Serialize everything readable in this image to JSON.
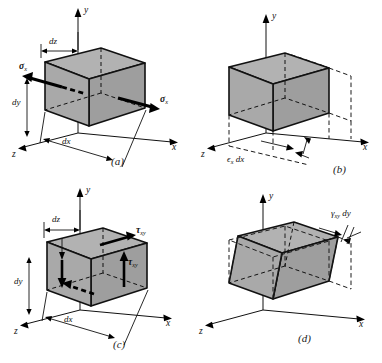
{
  "figure": {
    "background_color": "#ffffff",
    "face_color": "#a9a9a9",
    "line_color": "#111111"
  },
  "panels": [
    {
      "id": "a",
      "caption": "(a)",
      "description": "Cube element with normal stress sigma-x applied on both x-faces",
      "axes": {
        "x": "x",
        "y": "y",
        "z": "z"
      },
      "dimensions": [
        {
          "name": "dz",
          "label": "dz"
        },
        {
          "name": "dy",
          "label": "dy"
        },
        {
          "name": "dx",
          "label": "dx"
        }
      ],
      "stress_labels": [
        {
          "name": "sigma-x-left",
          "symbol": "σ",
          "subscript": "x"
        },
        {
          "name": "sigma-x-right",
          "symbol": "σ",
          "subscript": "x"
        }
      ]
    },
    {
      "id": "b",
      "caption": "(b)",
      "description": "Deformed cube showing normal strain elongation epsilon-x dx with dashed original outline",
      "axes": {
        "x": "x",
        "y": "y",
        "z": "z"
      },
      "dimensions": [],
      "strain_labels": [
        {
          "name": "epsilon-x-dx",
          "symbol": "ϵ",
          "subscript": "x",
          "suffix": "dx"
        }
      ]
    },
    {
      "id": "c",
      "caption": "(c)",
      "description": "Cube element with shear stress tau-xy applied on faces",
      "axes": {
        "x": "x",
        "y": "y",
        "z": "z"
      },
      "dimensions": [
        {
          "name": "dz",
          "label": "dz"
        },
        {
          "name": "dy",
          "label": "dy"
        },
        {
          "name": "dx",
          "label": "dx"
        }
      ],
      "stress_labels": [
        {
          "name": "tau-xy-top",
          "symbol": "τ",
          "subscript": "xy"
        },
        {
          "name": "tau-xy-right",
          "symbol": "τ",
          "subscript": "xy"
        }
      ]
    },
    {
      "id": "d",
      "caption": "(d)",
      "description": "Sheared cube showing shear strain displacement gamma-xy dy with dashed original outline",
      "axes": {
        "x": "x",
        "y": "y",
        "z": "z"
      },
      "dimensions": [],
      "strain_labels": [
        {
          "name": "gamma-xy-dy",
          "symbol": "γ",
          "subscript": "xy",
          "suffix": "dy"
        }
      ]
    }
  ],
  "axis_labels": {
    "x": "x",
    "y": "y",
    "z": "z"
  },
  "text": {
    "dz": "dz",
    "dy": "dy",
    "dx": "dx",
    "epsilon": "ϵ",
    "sigma": "σ",
    "tau": "τ",
    "gamma": "γ",
    "sub_x": "x",
    "sub_xy": "xy",
    "suffix_dx": "dx",
    "suffix_dy": "dy",
    "cap_a": "(a)",
    "cap_b": "(b)",
    "cap_c": "(c)",
    "cap_d": "(d)"
  }
}
